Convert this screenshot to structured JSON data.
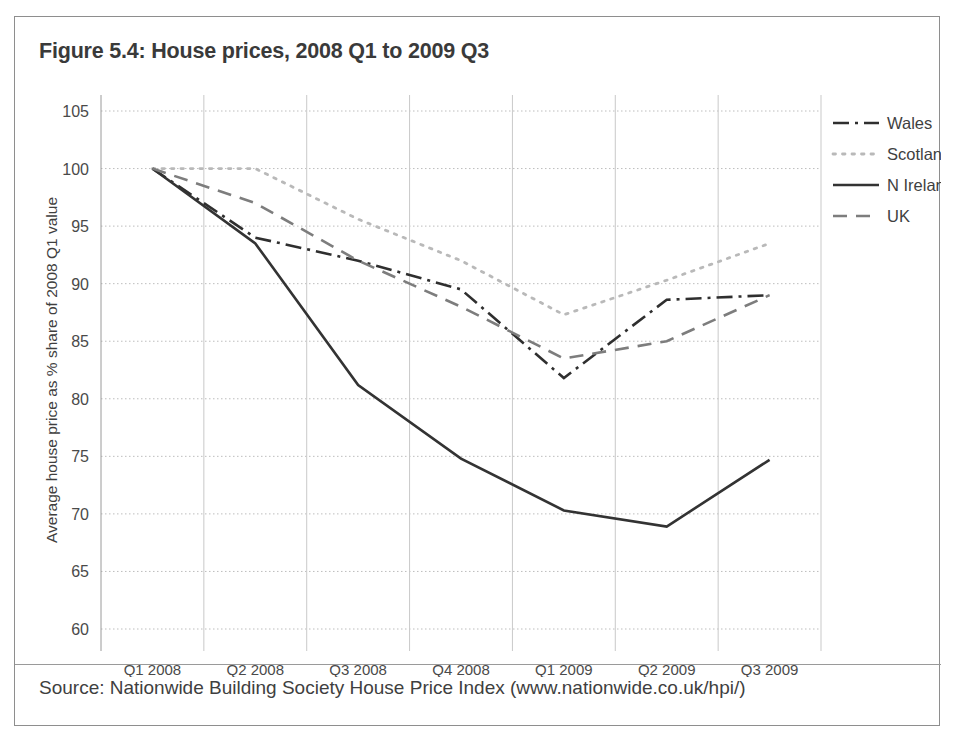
{
  "figure": {
    "title": "Figure 5.4: House prices, 2008 Q1 to 2009 Q3",
    "source": "Source: Nationwide Building Society House Price Index (www.nationwide.co.uk/hpi/)"
  },
  "chart_data": {
    "type": "line",
    "title": "Figure 5.4: House prices, 2008 Q1 to 2009 Q3",
    "xlabel": "",
    "ylabel": "Average house price as % share of 2008 Q1 value",
    "categories": [
      "Q1 2008",
      "Q2 2008",
      "Q3 2008",
      "Q4 2008",
      "Q1 2009",
      "Q2 2009",
      "Q3 2009"
    ],
    "ylim": [
      60,
      105
    ],
    "yticks": [
      60,
      65,
      70,
      75,
      80,
      85,
      90,
      95,
      100,
      105
    ],
    "grid": true,
    "legend_position": "top-right",
    "series": [
      {
        "name": "Wales",
        "style": "dash-dot",
        "color": "#2f2f2f",
        "values": [
          100.0,
          94.0,
          92.0,
          89.5,
          81.8,
          88.6,
          89.0
        ]
      },
      {
        "name": "Scotland",
        "style": "dotted",
        "color": "#b9b9b9",
        "values": [
          100.0,
          100.0,
          95.6,
          92.0,
          87.3,
          90.3,
          93.5
        ]
      },
      {
        "name": "N Ireland",
        "style": "solid",
        "color": "#333333",
        "values": [
          100.0,
          93.5,
          81.2,
          74.8,
          70.3,
          68.9,
          74.7
        ]
      },
      {
        "name": "UK",
        "style": "dashed",
        "color": "#7d7d7d",
        "values": [
          100.0,
          97.0,
          92.0,
          88.0,
          83.5,
          85.0,
          89.0
        ]
      }
    ]
  }
}
